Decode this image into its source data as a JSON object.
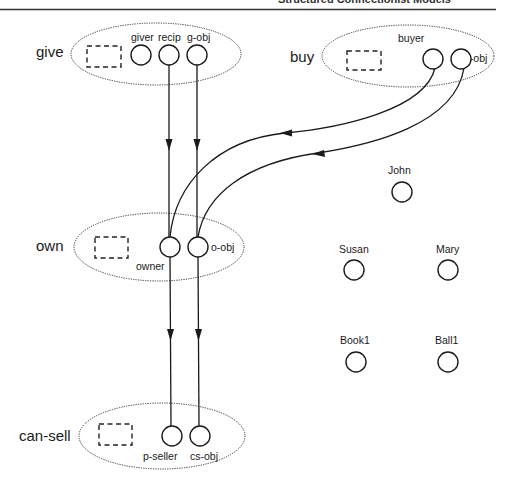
{
  "header": {
    "running_title": "Structured Connectionist Models"
  },
  "frames": [
    {
      "id": "give",
      "label": "give",
      "roles": [
        {
          "id": "giver",
          "label": "giver"
        },
        {
          "id": "recip",
          "label": "recip"
        },
        {
          "id": "g-obj",
          "label": "g-obj"
        }
      ]
    },
    {
      "id": "buy",
      "label": "buy",
      "roles": [
        {
          "id": "buyer",
          "label": "buyer"
        },
        {
          "id": "b-obj",
          "label": "b-obj"
        }
      ]
    },
    {
      "id": "own",
      "label": "own",
      "roles": [
        {
          "id": "owner",
          "label": "owner"
        },
        {
          "id": "o-obj",
          "label": "o-obj"
        }
      ]
    },
    {
      "id": "can-sell",
      "label": "can-sell",
      "roles": [
        {
          "id": "p-seller",
          "label": "p-seller"
        },
        {
          "id": "cs-obj",
          "label": "cs-obj"
        }
      ]
    }
  ],
  "entities": [
    {
      "id": "john",
      "label": "John"
    },
    {
      "id": "susan",
      "label": "Susan"
    },
    {
      "id": "mary",
      "label": "Mary"
    },
    {
      "id": "book1",
      "label": "Book1"
    },
    {
      "id": "ball1",
      "label": "Ball1"
    }
  ],
  "links": [
    {
      "from": "recip",
      "to": "owner"
    },
    {
      "from": "g-obj",
      "to": "o-obj"
    },
    {
      "from": "buyer",
      "to": "owner"
    },
    {
      "from": "b-obj",
      "to": "o-obj"
    },
    {
      "from": "owner",
      "to": "p-seller"
    },
    {
      "from": "o-obj",
      "to": "cs-obj"
    }
  ],
  "colors": {
    "ink": "#1a1a1a",
    "background": "#ffffff"
  }
}
